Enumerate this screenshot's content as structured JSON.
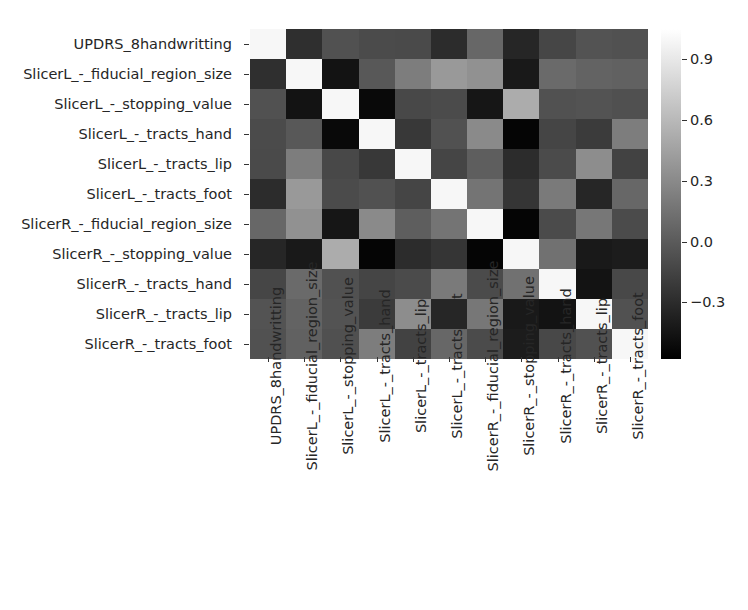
{
  "chart_data": {
    "type": "heatmap",
    "title": "",
    "xlabel": "",
    "ylabel": "",
    "colormap": "gray",
    "grid": false,
    "legend_position": "right",
    "colorbar": {
      "ticks": [
        "0.9",
        "0.6",
        "0.3",
        "0.0",
        "−0.3"
      ],
      "tick_values": [
        0.9,
        0.6,
        0.3,
        0.0,
        -0.3
      ],
      "vmin": -0.58,
      "vmax": 1.05
    },
    "categories": [
      "UPDRS_8handwritting",
      "SlicerL_-_fiducial_region_size",
      "SlicerL_-_stopping_value",
      "SlicerL_-_tracts_hand",
      "SlicerL_-_tracts_lip",
      "SlicerL_-_tracts_foot",
      "SlicerR_-_fiducial_region_size",
      "SlicerR_-_stopping_value",
      "SlicerR_-_tracts_hand",
      "SlicerR_-_tracts_lip",
      "SlicerR_-_tracts_foot"
    ],
    "x": [
      "UPDRS_8handwritting",
      "SlicerL_-_fiducial_region_size",
      "SlicerL_-_stopping_value",
      "SlicerL_-_tracts_hand",
      "SlicerL_-_tracts_lip",
      "SlicerL_-_tracts_foot",
      "SlicerR_-_fiducial_region_size",
      "SlicerR_-_stopping_value",
      "SlicerR_-_tracts_hand",
      "SlicerR_-_tracts_lip",
      "SlicerR_-_tracts_foot"
    ],
    "values": [
      [
        1.0,
        -0.28,
        -0.06,
        -0.1,
        -0.11,
        -0.3,
        0.08,
        -0.34,
        -0.13,
        -0.05,
        -0.06
      ],
      [
        -0.28,
        1.0,
        -0.46,
        -0.02,
        0.22,
        0.4,
        0.35,
        -0.42,
        0.1,
        0.05,
        0.04
      ],
      [
        -0.06,
        -0.46,
        1.0,
        -0.52,
        -0.12,
        -0.1,
        -0.44,
        0.52,
        -0.06,
        -0.05,
        -0.07
      ],
      [
        -0.1,
        -0.02,
        -0.52,
        1.0,
        -0.22,
        -0.06,
        0.3,
        -0.55,
        -0.14,
        -0.2,
        0.22
      ],
      [
        -0.11,
        0.22,
        -0.12,
        -0.22,
        1.0,
        -0.14,
        0.02,
        -0.3,
        -0.1,
        0.32,
        -0.16
      ],
      [
        -0.3,
        0.4,
        -0.1,
        -0.06,
        -0.14,
        1.0,
        0.16,
        -0.24,
        0.2,
        -0.34,
        0.08
      ],
      [
        0.08,
        0.35,
        -0.44,
        0.3,
        0.02,
        0.16,
        1.0,
        -0.55,
        -0.1,
        0.18,
        -0.1
      ],
      [
        -0.34,
        -0.42,
        0.52,
        -0.55,
        -0.3,
        -0.24,
        -0.55,
        1.0,
        0.14,
        -0.42,
        -0.4
      ],
      [
        -0.13,
        0.1,
        -0.06,
        -0.14,
        -0.1,
        0.2,
        -0.1,
        0.14,
        1.0,
        -0.46,
        -0.12
      ],
      [
        -0.05,
        0.05,
        -0.05,
        -0.2,
        0.32,
        -0.34,
        0.18,
        -0.42,
        -0.46,
        1.0,
        -0.06
      ],
      [
        -0.06,
        0.04,
        -0.07,
        0.22,
        -0.16,
        0.08,
        -0.1,
        -0.4,
        -0.12,
        -0.06,
        1.0
      ]
    ]
  }
}
